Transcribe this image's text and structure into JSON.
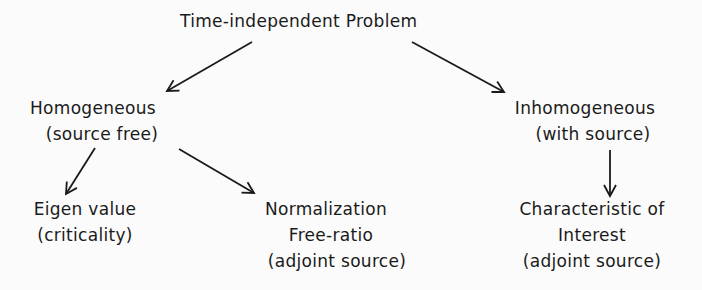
{
  "diagram": {
    "root": {
      "lines": [
        "Time-independent Problem"
      ]
    },
    "homogeneous": {
      "lines": [
        "Homogeneous",
        "(source free)"
      ]
    },
    "inhomogeneous": {
      "lines": [
        "Inhomogeneous",
        "(with source)"
      ]
    },
    "eigen": {
      "lines": [
        "Eigen value",
        "(criticality)"
      ]
    },
    "normalization": {
      "lines": [
        "Normalization",
        "Free-ratio",
        "(adjoint source)"
      ]
    },
    "characteristic": {
      "lines": [
        "Characteristic of",
        "Interest",
        "(adjoint source)"
      ]
    },
    "edges": [
      {
        "from": "root",
        "to": "homogeneous"
      },
      {
        "from": "root",
        "to": "inhomogeneous"
      },
      {
        "from": "homogeneous",
        "to": "eigen"
      },
      {
        "from": "homogeneous",
        "to": "normalization"
      },
      {
        "from": "inhomogeneous",
        "to": "characteristic"
      }
    ]
  }
}
